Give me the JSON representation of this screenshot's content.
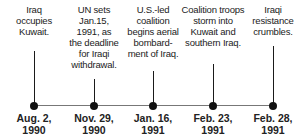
{
  "timeline": {
    "events": [
      {
        "desc": [
          "Iraq",
          "occupies",
          "Kuwait."
        ],
        "date": [
          "Aug. 2,",
          "1990"
        ],
        "x": 34,
        "stem_top": 51
      },
      {
        "desc": [
          "UN sets",
          "Jan.15,",
          "1991, as",
          "the deadline",
          "for Iraqi",
          "withdrawal."
        ],
        "date": [
          "Nov. 29,",
          "1990"
        ],
        "x": 94,
        "stem_top": 79
      },
      {
        "desc": [
          "U.S.-led",
          "coalition",
          "begins aerial",
          "bombard-",
          "ment of Iraq."
        ],
        "date": [
          "Jan. 16,",
          "1991"
        ],
        "x": 153,
        "stem_top": 71
      },
      {
        "desc": [
          "Coalition troops",
          "storm into",
          "Kuwait and",
          "southern Iraq."
        ],
        "date": [
          "Feb. 23,",
          "1991"
        ],
        "x": 213,
        "stem_top": 64
      },
      {
        "desc": [
          "Iraqi",
          "resistance",
          "crumbles."
        ],
        "date": [
          "Feb. 28,",
          "1991"
        ],
        "x": 273,
        "stem_top": 46
      }
    ],
    "colors": {
      "axis": "#777777",
      "stem": "#1a1a1a",
      "dot": "#111111",
      "text": "#222222"
    }
  }
}
